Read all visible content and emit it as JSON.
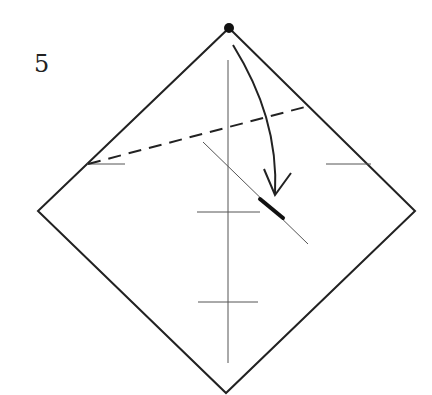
{
  "diagram": {
    "type": "origami-instruction-step",
    "step_number": "5",
    "colors": {
      "paper_outline": "#222222",
      "crease_line": "#555555",
      "fold_line": "#222222",
      "arrow": "#222222",
      "background": "#ffffff"
    },
    "paper": {
      "shape": "square-rotated-45",
      "vertices": {
        "top": [
          229,
          28
        ],
        "right": [
          415,
          211
        ],
        "bottom": [
          226,
          393
        ],
        "left": [
          38,
          211
        ]
      }
    },
    "marks": {
      "top_corner_dot": [
        229,
        28
      ],
      "vertical_crease": {
        "x": 228,
        "y1": 60,
        "y2": 363
      },
      "horizontal_ticks": [
        {
          "x1": 197,
          "x2": 260,
          "y": 212
        },
        {
          "x1": 198,
          "x2": 258,
          "y": 302
        },
        {
          "x1": 87,
          "x2": 125,
          "y": 164
        },
        {
          "x1": 326,
          "x2": 371,
          "y": 164
        }
      ],
      "diagonal_crease": {
        "x1": 203,
        "y1": 142,
        "x2": 308,
        "y2": 244
      },
      "landmark_segment": {
        "x1": 260,
        "y1": 199,
        "x2": 283,
        "y2": 218
      },
      "valley_fold_dashed_line": {
        "x1": 87,
        "y1": 164,
        "x2": 305,
        "y2": 107
      }
    },
    "arrow": {
      "kind": "valley-fold-arrow",
      "start": [
        233,
        44
      ],
      "end": [
        275,
        195
      ]
    }
  }
}
